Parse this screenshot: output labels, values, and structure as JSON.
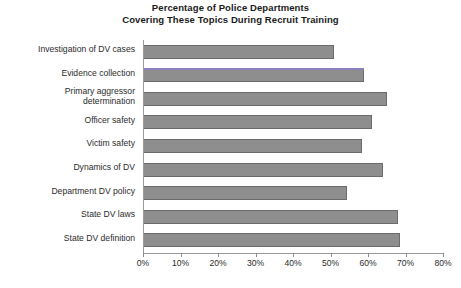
{
  "chart_data": {
    "type": "bar",
    "orientation": "horizontal",
    "title": "Percentage of Police Departments Covering These Topics During Recruit Training",
    "title_lines": [
      "Percentage of Police Departments",
      "Covering These Topics During Recruit Training"
    ],
    "xlabel": "",
    "ylabel": "",
    "xlim": [
      0,
      80
    ],
    "xtick_labels": [
      "0%",
      "10%",
      "20%",
      "30%",
      "40%",
      "50%",
      "60%",
      "70%",
      "80%"
    ],
    "xtick_values": [
      0,
      10,
      20,
      30,
      40,
      50,
      60,
      70,
      80
    ],
    "grid": false,
    "legend": false,
    "categories": [
      "Investigation of DV cases",
      "Evidence collection",
      "Primary aggressor determination",
      "Officer safety",
      "Victim safety",
      "Dynamics of DV",
      "Department DV policy",
      "State DV laws",
      "State DV definition"
    ],
    "category_label_lines": [
      [
        "Investigation of DV cases"
      ],
      [
        "Evidence collection"
      ],
      [
        "Primary aggressor",
        "determination"
      ],
      [
        "Officer safety"
      ],
      [
        "Victim safety"
      ],
      [
        "Dynamics of DV"
      ],
      [
        "Department DV policy"
      ],
      [
        "State DV laws"
      ],
      [
        "State DV definition"
      ]
    ],
    "values": [
      51,
      59,
      65,
      61,
      58.5,
      64,
      54.5,
      68,
      68.5
    ],
    "bar_color": "#8e8e8e",
    "bar_border_color": "#6b6b6b",
    "highlight_color": "#8d7fbe",
    "highlighted_category": "Evidence collection",
    "axis_color": "#9a9a9a",
    "background_color": "#ffffff",
    "text_color": "#2b2b2b"
  }
}
